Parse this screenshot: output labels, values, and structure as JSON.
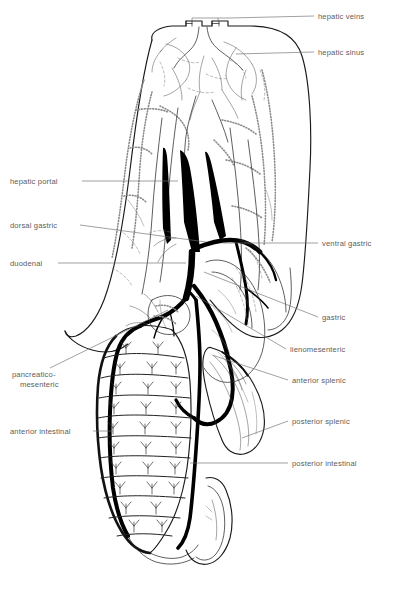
{
  "figure": {
    "background_color": "#ffffff",
    "line_color": "#000000",
    "label_color": "#5d5d5d",
    "leader_color": "#6e6e6e",
    "width": 394,
    "height": 594
  },
  "labels": {
    "hepatic_veins": "hepatic veins",
    "hepatic_sinus": "hepatic sinus",
    "hepatic_portal": "hepatic portal",
    "dorsal_gastric": "dorsal gastric",
    "duodenal": "duodenal",
    "ventral_gastric": "ventral gastric",
    "gastric": "gastric",
    "lienomesenteric": "lienomesenteric",
    "pancreatico_line1": "pancreatico-",
    "pancreatico_line2": "mesenteric",
    "anterior_splenic": "anterior splenic",
    "posterior_splenic": "posterior splenic",
    "anterior_intestinal": "anterior intestinal",
    "posterior_intestinal": "posterior intestinal"
  },
  "label_list": [
    {
      "key": "hepatic_veins",
      "text": "hepatic veins",
      "side": "right",
      "x": 318,
      "y": 19
    },
    {
      "key": "hepatic_sinus",
      "text": "hepatic sinus",
      "side": "right",
      "x": 318,
      "y": 55
    },
    {
      "key": "hepatic_portal",
      "text": "hepatic portal",
      "side": "left",
      "x": 10,
      "y": 184
    },
    {
      "key": "dorsal_gastric",
      "text": "dorsal gastric",
      "side": "left",
      "x": 10,
      "y": 228
    },
    {
      "key": "duodenal",
      "text": "duodenal",
      "side": "left",
      "x": 10,
      "y": 266
    },
    {
      "key": "ventral_gastric",
      "text": "ventral gastric",
      "side": "right",
      "x": 322,
      "y": 246
    },
    {
      "key": "gastric",
      "text": "gastric",
      "side": "right",
      "x": 322,
      "y": 320
    },
    {
      "key": "lienomesenteric",
      "text": "lienomesenteric",
      "side": "right",
      "x": 290,
      "y": 352
    },
    {
      "key": "pancreatico_mesenteric",
      "text": "pancreatico- mesenteric",
      "side": "left",
      "x": 12,
      "y": 377
    },
    {
      "key": "anterior_splenic",
      "text": "anterior splenic",
      "side": "right",
      "x": 292,
      "y": 383
    },
    {
      "key": "posterior_splenic",
      "text": "posterior splenic",
      "side": "right",
      "x": 292,
      "y": 424
    },
    {
      "key": "anterior_intestinal",
      "text": "anterior intestinal",
      "side": "left",
      "x": 10,
      "y": 434
    },
    {
      "key": "posterior_intestinal",
      "text": "posterior intestinal",
      "side": "right",
      "x": 292,
      "y": 466
    }
  ],
  "structures": {
    "liver": "liver",
    "stomach": "stomach",
    "intestine": "intestine",
    "spleen": "spleen",
    "pancreas": "pancreas",
    "rectal_pouch": "rectal pouch"
  }
}
